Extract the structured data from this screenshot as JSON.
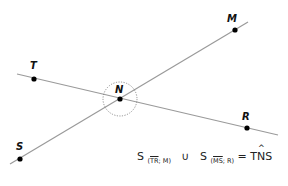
{
  "diagram": {
    "type": "two intersecting lines",
    "lines": [
      {
        "name": "line-SM",
        "from": [
          10,
          164
        ],
        "to": [
          248,
          22
        ],
        "through": [
          "S",
          "N",
          "M"
        ]
      },
      {
        "name": "line-TR",
        "from": [
          17,
          74
        ],
        "to": [
          278,
          135
        ],
        "through": [
          "T",
          "N",
          "R"
        ]
      }
    ],
    "points": [
      {
        "label": "M",
        "x": 235,
        "y": 30,
        "lx": 227,
        "ly": 22
      },
      {
        "label": "T",
        "x": 34,
        "y": 79,
        "lx": 30,
        "ly": 69
      },
      {
        "label": "N",
        "x": 120,
        "y": 99,
        "lx": 115,
        "ly": 93
      },
      {
        "label": "R",
        "x": 247,
        "y": 128,
        "lx": 242,
        "ly": 120
      },
      {
        "label": "S",
        "x": 20,
        "y": 159,
        "lx": 16,
        "ly": 150
      }
    ],
    "circle": {
      "cx": 120,
      "cy": 99,
      "r": 17,
      "style": "dotted"
    },
    "colors": {
      "line": "#9a9a9a",
      "point": "#000000",
      "circle": "#777777"
    }
  },
  "formula": {
    "s1": "S",
    "sub1_seg": "TR",
    "sub1_rest": "; M)",
    "sub1_open": "(",
    "union": "∪",
    "s2": "S",
    "sub2_open": "(",
    "sub2_seg": "MS",
    "sub2_rest": "; R)",
    "equals": "=",
    "angle_t": "T",
    "angle_n": "N",
    "angle_s": "S"
  }
}
